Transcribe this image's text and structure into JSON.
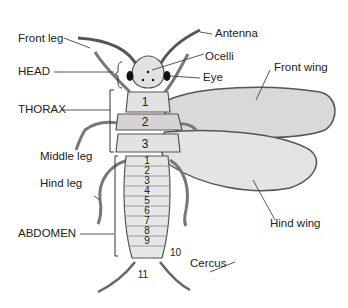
{
  "labels": {
    "front_leg": "Front leg",
    "antenna": "Antenna",
    "ocelli": "Ocelli",
    "eye": "Eye",
    "head": "HEAD",
    "front_wing": "Front wing",
    "thorax": "THORAX",
    "middle_leg": "Middle leg",
    "hind_leg": "Hind leg",
    "hind_wing": "Hind wing",
    "abdomen": "ABDOMEN",
    "cercus": "Cercus"
  },
  "thorax_segments": [
    "1",
    "2",
    "3"
  ],
  "abdomen_segments": [
    "1",
    "2",
    "3",
    "4",
    "5",
    "6",
    "7",
    "8",
    "9",
    "10",
    "11"
  ],
  "colors": {
    "body_fill": "#e2e2e2",
    "wing_fill": "#dadada",
    "outline": "#555555",
    "text": "#222222"
  }
}
